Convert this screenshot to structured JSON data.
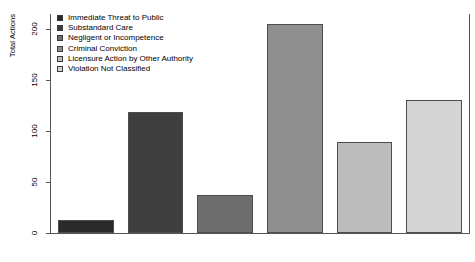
{
  "chart_data": {
    "type": "bar",
    "title": "",
    "subtitle": "",
    "xlabel": "",
    "ylabel": "Total Actions",
    "ylim": [
      0,
      215
    ],
    "yticks": [
      0,
      50,
      100,
      150,
      200
    ],
    "ytick_labels": [
      "0",
      "50",
      "100",
      "150",
      "200"
    ],
    "grid": false,
    "legend_position": "top-left",
    "categories": [
      "Immediate Threat to Public",
      "Substandard Care",
      "Negligent or Incompetence",
      "Criminal Conviction",
      "Licensure Action by Other Authority",
      "Violation Not Classified"
    ],
    "values": [
      13,
      119,
      37,
      205,
      89,
      131
    ],
    "colors": [
      "#2a2a2a",
      "#3f3f3f",
      "#6e6e6e",
      "#8f8f8f",
      "#bcbcbc",
      "#d4d4d4"
    ],
    "bar_border_color": "#4d4d4d",
    "axis_color": "#555555",
    "background": "#ffffff"
  },
  "legend": {
    "items": [
      {
        "label": "Immediate Threat to Public",
        "color": "#2a2a2a"
      },
      {
        "label": "Substandard Care",
        "color": "#3f3f3f"
      },
      {
        "label": "Negligent or Incompetence",
        "color": "#6e6e6e"
      },
      {
        "label": "Criminal Conviction",
        "color": "#8f8f8f"
      },
      {
        "label": "Licensure Action by Other Authority",
        "color": "#bcbcbc"
      },
      {
        "label": "Violation Not Classified",
        "color": "#d4d4d4"
      }
    ]
  }
}
